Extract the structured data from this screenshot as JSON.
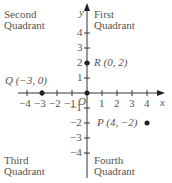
{
  "quadrants": {
    "second": [
      "Second",
      "Quadrant"
    ],
    "first": [
      "First",
      "Quadrant"
    ],
    "third": [
      "Third",
      "Quadrant"
    ],
    "fourth": [
      "Fourth",
      "Quadrant"
    ]
  },
  "axes": {
    "x_label": "x",
    "y_label": "y",
    "origin_label": "O",
    "x_ticks": [
      -4,
      -3,
      -2,
      -1,
      1,
      2,
      3,
      4
    ],
    "y_ticks": [
      4,
      3,
      2,
      1,
      -1,
      -2,
      -3,
      -4
    ]
  },
  "points": [
    {
      "name": "Q",
      "x": -3,
      "y": 0,
      "label": "Q (−3, 0)"
    },
    {
      "name": "R",
      "x": 0,
      "y": 2,
      "label": "R (0, 2)"
    },
    {
      "name": "P",
      "x": 4,
      "y": -2,
      "label": "P (4, −2)"
    }
  ],
  "colors": {
    "axis": "#333333",
    "text": "#555555",
    "point": "#222222"
  }
}
